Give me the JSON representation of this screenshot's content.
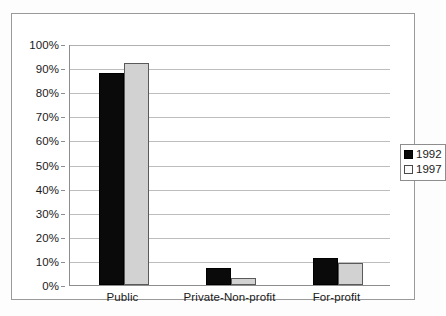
{
  "chart_data": {
    "type": "bar",
    "title": "",
    "subtitle": "",
    "xlabel": "",
    "ylabel": "",
    "categories": [
      "Public",
      "Private-Non-profit",
      "For-profit"
    ],
    "series": [
      {
        "name": "1992",
        "values": [
          88,
          7,
          11
        ],
        "color": "#0a0a0a"
      },
      {
        "name": "1997",
        "values": [
          92,
          3,
          9
        ],
        "color": "#d2d2d2"
      }
    ],
    "ylim": [
      0,
      100
    ],
    "ytick_step": 10,
    "ytick_labels": [
      "0%",
      "10%",
      "20%",
      "30%",
      "40%",
      "50%",
      "60%",
      "70%",
      "80%",
      "90%",
      "100%"
    ],
    "ytick_values": [
      0,
      10,
      20,
      30,
      40,
      50,
      60,
      70,
      80,
      90,
      100
    ],
    "grid": "horizontal",
    "legend_position": "right",
    "legend_entries": [
      "1992",
      "1997"
    ]
  },
  "colors": {
    "series_1992": "#0a0a0a",
    "series_1997": "#d2d2d2",
    "gridline": "#bdbdbd",
    "axis": "#8d8d8d",
    "frame": "#9a9a9a",
    "text": "#1a1a1a",
    "background": "#ffffff"
  }
}
